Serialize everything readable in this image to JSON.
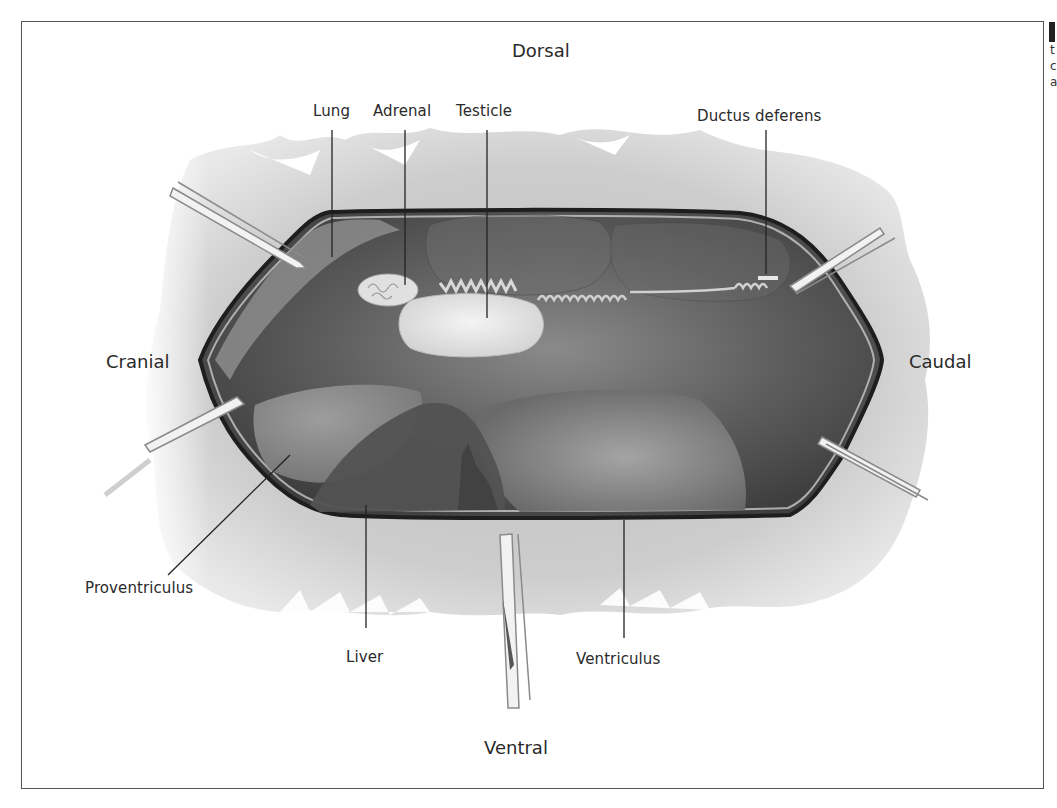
{
  "figure": {
    "orientation_labels": {
      "top": "Dorsal",
      "bottom": "Ventral",
      "left": "Cranial",
      "right": "Caudal"
    },
    "structure_labels": {
      "lung": "Lung",
      "adrenal": "Adrenal",
      "testicle": "Testicle",
      "ductus_deferens": "Ductus deferens",
      "proventriculus": "Proventriculus",
      "liver": "Liver",
      "ventriculus": "Ventriculus"
    },
    "retractors": [
      "upper-left retractor",
      "lower-left retractor",
      "upper-right retractor",
      "lower-right retractor",
      "bottom retractor"
    ]
  },
  "adjacent_page": {
    "edge_letters": [
      "t",
      "c",
      "a"
    ]
  },
  "colors": {
    "background": "#ffffff",
    "frame_border": "#555555",
    "skin_gray": "#cfcfcf",
    "coelom_dark": "#5a5a5a",
    "organ_light": "#e6e6e6",
    "leader_line": "#222222"
  }
}
